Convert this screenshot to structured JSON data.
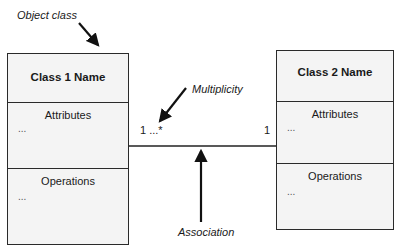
{
  "annotations": {
    "object_class": "Object class",
    "multiplicity": "Multiplicity",
    "association": "Association"
  },
  "class1": {
    "name": "Class 1 Name",
    "attributes_label": "Attributes",
    "attributes_placeholder": "...",
    "operations_label": "Operations",
    "operations_placeholder": "..."
  },
  "class2": {
    "name": "Class 2 Name",
    "attributes_label": "Attributes",
    "attributes_placeholder": "...",
    "operations_label": "Operations",
    "operations_placeholder": "..."
  },
  "association": {
    "left_multiplicity": "1 ...*",
    "right_multiplicity": "1"
  }
}
